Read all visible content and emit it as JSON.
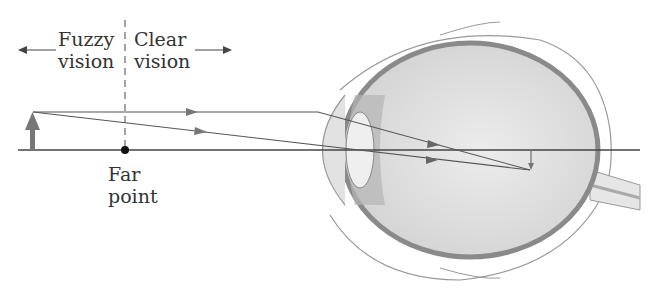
{
  "labels": {
    "fuzzy_line1": "Fuzzy",
    "fuzzy_line2": "vision",
    "clear_line1": "Clear",
    "clear_line2": "vision",
    "far_line1": "Far",
    "far_line2": "point"
  },
  "colors": {
    "line": "#444444",
    "arrow": "#777777",
    "eye_outline": "#999999",
    "eye_fill": "#dedede",
    "choroid": "#8a8a8a"
  }
}
